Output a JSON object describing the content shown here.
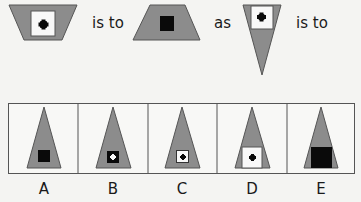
{
  "question": {
    "connector_1": "is to",
    "connector_2": "as",
    "connector_3": "is to",
    "shapes": [
      {
        "name": "inverted-trapezoid-with-white-square-and-black-dot"
      },
      {
        "name": "trapezoid-with-black-square"
      },
      {
        "name": "inverted-triangle-with-white-square-and-black-dot"
      }
    ]
  },
  "options": [
    {
      "label": "A",
      "description": "triangle with black square"
    },
    {
      "label": "B",
      "description": "triangle with black square and white dot"
    },
    {
      "label": "C",
      "description": "triangle with small white square and black dot"
    },
    {
      "label": "D",
      "description": "triangle with wide white square and black dot"
    },
    {
      "label": "E",
      "description": "triangle with large black square"
    }
  ],
  "colors": {
    "shape_fill": "#8c8c8c",
    "shape_stroke": "#555555",
    "black": "#0a0a0a",
    "white": "#f8f8f8",
    "box_border": "#555555"
  }
}
